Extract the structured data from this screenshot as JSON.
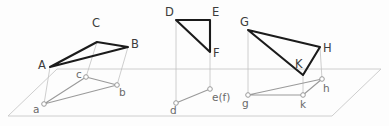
{
  "figure": {
    "canvas": {
      "width": 389,
      "height": 126
    },
    "colors": {
      "solid_stroke": "#1b1b1b",
      "projection_stroke": "#9a9a9a",
      "plane_stroke": "#c8c8c8",
      "projector_stroke": "#bdbdbd",
      "background": "#fdfdfd",
      "label_upper": "#3c3c3c",
      "label_lower": "#6a6a6a",
      "node_fill": "#ffffff"
    },
    "ground_plane": {
      "name": "horizontal-reference-plane",
      "points": "8,116 57,69 381,69 332,116"
    },
    "figures": [
      {
        "id": "abc",
        "name": "triangle-abc",
        "solid_polygon": "50,67 97,42 128,47",
        "projection_polygon": "44,104 86,77 117,85",
        "vertices": [
          {
            "label": "A",
            "class": "upper",
            "vx": 50,
            "vy": 67,
            "tx": 38,
            "ty": 69
          },
          {
            "label": "B",
            "class": "upper",
            "vx": 128,
            "vy": 47,
            "tx": 131,
            "ty": 48
          },
          {
            "label": "C",
            "class": "upper",
            "vx": 97,
            "vy": 42,
            "tx": 92,
            "ty": 27
          },
          {
            "label": "a",
            "class": "lower",
            "vx": 44,
            "vy": 104,
            "tx": 33,
            "ty": 113
          },
          {
            "label": "b",
            "class": "lower",
            "vx": 117,
            "vy": 85,
            "tx": 119,
            "ty": 96
          },
          {
            "label": "c",
            "class": "lower",
            "vx": 86,
            "vy": 77,
            "tx": 76,
            "ty": 78
          }
        ],
        "projectors": [
          {
            "x1": 50,
            "y1": 67,
            "x2": 44,
            "y2": 104
          },
          {
            "x1": 128,
            "y1": 47,
            "x2": 117,
            "y2": 85
          },
          {
            "x1": 97,
            "y1": 42,
            "x2": 86,
            "y2": 77
          }
        ]
      },
      {
        "id": "def",
        "name": "triangle-def",
        "solid_polygon": "176,20 210,20 210,52",
        "projection_polygon": "176,103 210,89 210,89",
        "vertices": [
          {
            "label": "D",
            "class": "upper",
            "vx": 176,
            "vy": 20,
            "tx": 165,
            "ty": 16
          },
          {
            "label": "E",
            "class": "upper",
            "vx": 210,
            "vy": 20,
            "tx": 212,
            "ty": 16
          },
          {
            "label": "F",
            "class": "upper",
            "vx": 210,
            "vy": 52,
            "tx": 213,
            "ty": 57
          },
          {
            "label": "d",
            "class": "lower",
            "vx": 176,
            "vy": 103,
            "tx": 170,
            "ty": 114
          },
          {
            "label": "e(f)",
            "class": "lower",
            "vx": 210,
            "vy": 89,
            "tx": 212,
            "ty": 101
          }
        ],
        "projectors": [
          {
            "x1": 176,
            "y1": 20,
            "x2": 176,
            "y2": 103
          },
          {
            "x1": 210,
            "y1": 20,
            "x2": 210,
            "y2": 89
          }
        ]
      },
      {
        "id": "ghk",
        "name": "triangle-ghk",
        "solid_polygon": "248,30 320,47 303,75",
        "projection_polygon": "248,95 322,79 303,95",
        "vertices": [
          {
            "label": "G",
            "class": "upper",
            "vx": 248,
            "vy": 30,
            "tx": 240,
            "ty": 26
          },
          {
            "label": "H",
            "class": "upper",
            "vx": 320,
            "vy": 47,
            "tx": 323,
            "ty": 52
          },
          {
            "label": "K",
            "class": "upper",
            "vx": 303,
            "vy": 75,
            "tx": 295,
            "ty": 68
          },
          {
            "label": "g",
            "class": "lower",
            "vx": 248,
            "vy": 95,
            "tx": 242,
            "ty": 107
          },
          {
            "label": "h",
            "class": "lower",
            "vx": 322,
            "vy": 79,
            "tx": 323,
            "ty": 92
          },
          {
            "label": "k",
            "class": "lower",
            "vx": 303,
            "vy": 95,
            "tx": 300,
            "ty": 108
          }
        ],
        "projectors": [
          {
            "x1": 248,
            "y1": 30,
            "x2": 248,
            "y2": 95
          },
          {
            "x1": 320,
            "y1": 47,
            "x2": 322,
            "y2": 79
          },
          {
            "x1": 303,
            "y1": 75,
            "x2": 303,
            "y2": 95
          }
        ]
      }
    ]
  }
}
